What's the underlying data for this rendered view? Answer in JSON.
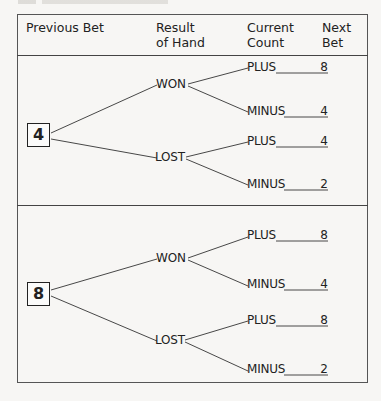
{
  "header": {
    "columns": [
      {
        "line1": "Previous Bet",
        "line2": ""
      },
      {
        "line1": "Result",
        "line2": "of Hand"
      },
      {
        "line1": "Current",
        "line2": "Count"
      },
      {
        "line1": "Next",
        "line2": "Bet"
      }
    ]
  },
  "sections": [
    {
      "previous_bet": "4",
      "branches": [
        {
          "result": "WON",
          "outcomes": [
            {
              "count": "PLUS",
              "next_bet": "8"
            },
            {
              "count": "MINUS",
              "next_bet": "4"
            }
          ]
        },
        {
          "result": "LOST",
          "outcomes": [
            {
              "count": "PLUS",
              "next_bet": "4"
            },
            {
              "count": "MINUS",
              "next_bet": "2"
            }
          ]
        }
      ]
    },
    {
      "previous_bet": "8",
      "branches": [
        {
          "result": "WON",
          "outcomes": [
            {
              "count": "PLUS",
              "next_bet": "8"
            },
            {
              "count": "MINUS",
              "next_bet": "4"
            }
          ]
        },
        {
          "result": "LOST",
          "outcomes": [
            {
              "count": "PLUS",
              "next_bet": "8"
            },
            {
              "count": "MINUS",
              "next_bet": "2"
            }
          ]
        }
      ]
    }
  ]
}
